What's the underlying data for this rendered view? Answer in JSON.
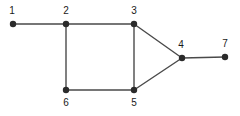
{
  "figure": {
    "name": "undirected-graph-diagram",
    "background_color": "#ffffff",
    "width": 240,
    "height": 116
  },
  "style": {
    "node_color": "#2b2b2b",
    "node_radius": 3.2,
    "edge_color": "#4a4a4a",
    "edge_width": 1.4,
    "label_color": "#1a1a1a",
    "label_font_size": 10
  },
  "chart_data": {
    "type": "diagram",
    "subtype": "node-link-graph",
    "title": "",
    "directed": false,
    "node_count": 7,
    "edge_count": 8,
    "nodes": [
      {
        "id": "1",
        "label": "1",
        "x": 13,
        "y": 24,
        "label_x": 12,
        "label_y": 11,
        "label_position": "above"
      },
      {
        "id": "2",
        "label": "2",
        "x": 66,
        "y": 24,
        "label_x": 66,
        "label_y": 11,
        "label_position": "above"
      },
      {
        "id": "3",
        "label": "3",
        "x": 134,
        "y": 24,
        "label_x": 134,
        "label_y": 11,
        "label_position": "above"
      },
      {
        "id": "4",
        "label": "4",
        "x": 182,
        "y": 58,
        "label_x": 181,
        "label_y": 45,
        "label_position": "above"
      },
      {
        "id": "5",
        "label": "5",
        "x": 134,
        "y": 90,
        "label_x": 134,
        "label_y": 103,
        "label_position": "below"
      },
      {
        "id": "6",
        "label": "6",
        "x": 66,
        "y": 90,
        "label_x": 66,
        "label_y": 103,
        "label_position": "below"
      },
      {
        "id": "7",
        "label": "7",
        "x": 225,
        "y": 57,
        "label_x": 225,
        "label_y": 44,
        "label_position": "above"
      }
    ],
    "edges": [
      {
        "source": "1",
        "target": "2"
      },
      {
        "source": "2",
        "target": "3"
      },
      {
        "source": "2",
        "target": "6"
      },
      {
        "source": "3",
        "target": "5"
      },
      {
        "source": "3",
        "target": "4"
      },
      {
        "source": "6",
        "target": "5"
      },
      {
        "source": "5",
        "target": "4"
      },
      {
        "source": "4",
        "target": "7"
      }
    ]
  }
}
